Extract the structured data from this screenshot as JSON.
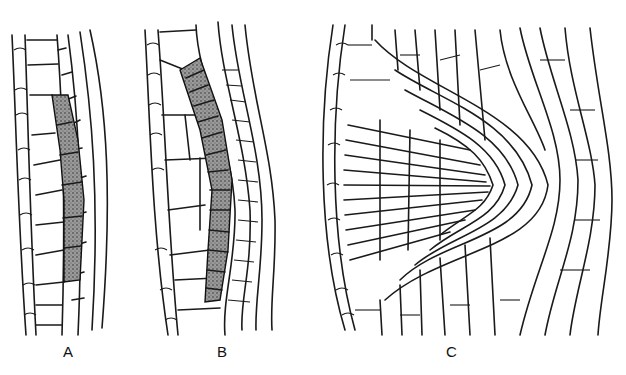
{
  "figure": {
    "panels": [
      {
        "label": "A",
        "x": 70,
        "y": 350
      },
      {
        "label": "B",
        "x": 222,
        "y": 350
      },
      {
        "label": "C",
        "x": 451,
        "y": 350
      }
    ]
  }
}
